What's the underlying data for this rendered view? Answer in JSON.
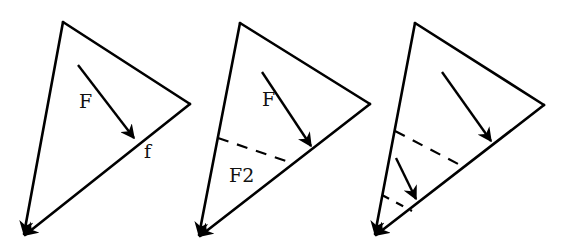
{
  "figure": {
    "panels": [
      {
        "id": "panel-1",
        "triangle": {
          "top": [
            63,
            22
          ],
          "right": [
            190,
            104
          ],
          "bottom": [
            22,
            237
          ]
        },
        "force_arrow": {
          "from": [
            78,
            65
          ],
          "to": [
            136,
            140
          ],
          "label": "F"
        },
        "edge_label": "f",
        "dashed_lines": [],
        "labels": {
          "force": "F",
          "edge": "f"
        }
      },
      {
        "id": "panel-2",
        "triangle": {
          "top": [
            240,
            23
          ],
          "right": [
            370,
            104
          ],
          "bottom": [
            197,
            238
          ]
        },
        "force_arrow": {
          "from": [
            262,
            72
          ],
          "to": [
            313,
            148
          ],
          "label": "F"
        },
        "dashed_lines": [
          [
            [
              218,
              138
            ],
            [
              292,
              163
            ]
          ]
        ],
        "labels": {
          "force": "F",
          "sub_region": "F2"
        }
      },
      {
        "id": "panel-3",
        "triangle": {
          "top": [
            415,
            23
          ],
          "right": [
            544,
            105
          ],
          "bottom": [
            373,
            237
          ]
        },
        "force_arrow": {
          "from": [
            442,
            72
          ],
          "to": [
            493,
            143
          ]
        },
        "secondary_arrow": {
          "from": [
            396,
            158
          ],
          "to": [
            418,
            201
          ]
        },
        "dashed_lines": [
          [
            [
              395,
              131
            ],
            [
              462,
              166
            ]
          ],
          [
            [
              382,
              195
            ],
            [
              412,
              211
            ]
          ]
        ],
        "labels": {}
      }
    ],
    "colors": {
      "stroke": "#000000",
      "background": "#ffffff"
    }
  }
}
